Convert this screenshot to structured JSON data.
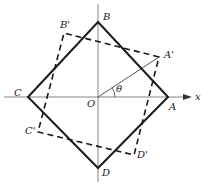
{
  "diagram": {
    "axes": {
      "x_label": "x",
      "origin_label": "O"
    },
    "angle_label": "θ",
    "solid_square": {
      "vertices": [
        {
          "name": "A",
          "label": "A",
          "x": 168,
          "y": 97
        },
        {
          "name": "B",
          "label": "B",
          "x": 98,
          "y": 22
        },
        {
          "name": "C",
          "label": "C",
          "x": 28,
          "y": 97
        },
        {
          "name": "D",
          "label": "D",
          "x": 98,
          "y": 168
        }
      ]
    },
    "dashed_square": {
      "vertices": [
        {
          "name": "A'",
          "label": "A'",
          "x": 159,
          "y": 57
        },
        {
          "name": "B'",
          "label": "B'",
          "x": 64,
          "y": 33
        },
        {
          "name": "C'",
          "label": "C'",
          "x": 38,
          "y": 132
        },
        {
          "name": "D'",
          "label": "D'",
          "x": 134,
          "y": 155
        }
      ]
    },
    "colors": {
      "line": "#1a1a1a",
      "axis": "#666666",
      "background": "#ffffff"
    }
  }
}
